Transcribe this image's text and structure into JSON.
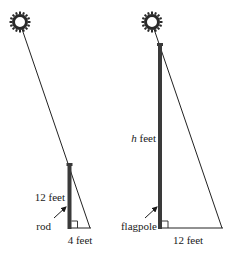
{
  "diagram": {
    "left": {
      "object_label": "rod",
      "height_label": "12 feet",
      "shadow_label": "4 feet",
      "sun_icon": "sun-icon"
    },
    "right": {
      "object_label": "flagpole",
      "height_var": "h",
      "height_unit": " feet",
      "shadow_label": "12 feet",
      "sun_icon": "sun-icon"
    },
    "colors": {
      "pole": "#3a3a3a",
      "line": "#222222",
      "sun": "#2a2a2a"
    }
  }
}
